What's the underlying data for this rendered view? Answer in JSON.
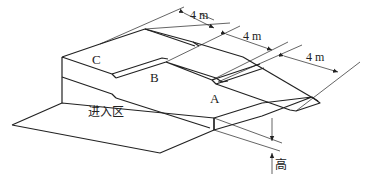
{
  "diagram": {
    "zones": [
      {
        "id": "A",
        "label": "A"
      },
      {
        "id": "B",
        "label": "B"
      },
      {
        "id": "C",
        "label": "C"
      }
    ],
    "entry_zone": {
      "label": "进入区"
    },
    "dimensions": [
      {
        "label": "4 m"
      },
      {
        "label": "4 m"
      },
      {
        "label": "4 m"
      }
    ],
    "height_label": "高",
    "colors": {
      "line": "#222222",
      "background": "#ffffff"
    }
  }
}
